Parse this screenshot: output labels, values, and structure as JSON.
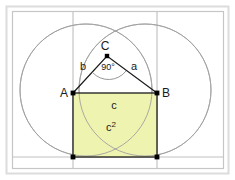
{
  "figure": {
    "background_color": "#ffffff",
    "frame": {
      "outer_color": "#d8d8d8",
      "inner_color": "#c4c4c4",
      "outer": {
        "x": 6,
        "y": 6,
        "w": 223,
        "h": 168
      },
      "inner": {
        "x": 12,
        "y": 11,
        "w": 212,
        "h": 158
      }
    },
    "colors": {
      "square_fill": "#eff3b0",
      "square_stroke": "#1a1a1a",
      "circle_stroke": "#9a9a9a",
      "guide_stroke": "#b0b0b0",
      "triangle_stroke": "#1a1a1a",
      "arc_stroke": "#8a8a8a",
      "point_fill": "#000000",
      "label_color": "#1a1a1a"
    },
    "points": [
      {
        "name": "A",
        "label": "A",
        "x": 73,
        "y": 93,
        "label_x": 64,
        "label_y": 96,
        "marker": "square"
      },
      {
        "name": "B",
        "label": "B",
        "x": 157,
        "y": 93,
        "label_x": 163,
        "label_y": 96,
        "marker": "square"
      },
      {
        "name": "C",
        "label": "C",
        "x": 107,
        "y": 56,
        "label_x": 105,
        "label_y": 50,
        "marker": "square"
      },
      {
        "name": "D",
        "label": "",
        "x": 73,
        "y": 157,
        "label_x": 0,
        "label_y": 0,
        "marker": "square"
      },
      {
        "name": "E",
        "label": "",
        "x": 157,
        "y": 157,
        "label_x": 0,
        "label_y": 0,
        "marker": "square"
      }
    ],
    "circles": [
      {
        "name": "circle-left",
        "cx": 86,
        "cy": 90,
        "r": 66
      },
      {
        "name": "circle-right",
        "cx": 145,
        "cy": 90,
        "r": 66
      }
    ],
    "guide_lines": [
      {
        "name": "vertical-guide-a",
        "x1": 73,
        "y1": 11,
        "x2": 73,
        "y2": 169
      },
      {
        "name": "vertical-guide-b",
        "x1": 157,
        "y1": 11,
        "x2": 157,
        "y2": 169
      },
      {
        "name": "horizontal-guide-bottom",
        "x1": 12,
        "y1": 157,
        "x2": 224,
        "y2": 157
      }
    ],
    "square": {
      "name": "square-c-squared",
      "x": 73,
      "y": 93,
      "w": 84,
      "h": 64,
      "fill": "#eff3b0"
    },
    "triangle": {
      "name": "right-triangle-abc",
      "vertices": "73,93 107,56 157,93"
    },
    "angle_marker": {
      "name": "right-angle-arc",
      "value": "90°",
      "label_x": 107,
      "label_y": 69,
      "path": "M 92.5 72.5 A 22 22 0 0 0 126 71.5"
    },
    "labels": {
      "side_a": {
        "text": "a",
        "x": 133,
        "y": 68
      },
      "side_b": {
        "text": "b",
        "x": 83,
        "y": 68
      },
      "side_c": {
        "text": "c",
        "x": 114,
        "y": 107
      },
      "area_c2": {
        "text": "c",
        "sup": "2",
        "x": 111,
        "y": 129
      }
    }
  }
}
